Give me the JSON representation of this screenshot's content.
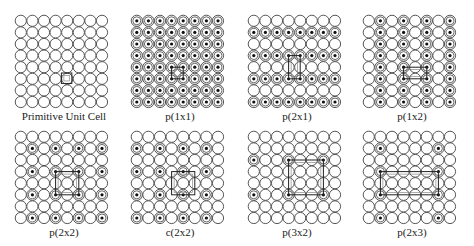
{
  "grid": {
    "rows": 8,
    "cols": 8,
    "pitch": 11.6,
    "radius": 5.6
  },
  "panels": [
    {
      "label": "Primitive Unit Cell",
      "x": 14,
      "y": 14,
      "dots": {
        "type": "none"
      },
      "cell": {
        "x0": 3.5,
        "y0": 4.5,
        "x1": 4.4,
        "y1": 5.4,
        "inner": true
      }
    },
    {
      "label": "p(1x1)",
      "x": 130,
      "y": 14,
      "dots": {
        "type": "all"
      },
      "cell": {
        "x0": 3,
        "y0": 4,
        "x1": 4,
        "y1": 5,
        "inner": true
      }
    },
    {
      "label": "p(2x1)",
      "x": 247,
      "y": 14,
      "dots": {
        "type": "rows",
        "step": 2,
        "offset": 1
      },
      "cell": {
        "x0": 3,
        "y0": 3,
        "x1": 4,
        "y1": 5,
        "inner": true
      }
    },
    {
      "label": "p(1x2)",
      "x": 362,
      "y": 14,
      "dots": {
        "type": "cols",
        "step": 2,
        "offset": 1
      },
      "cell": {
        "x0": 3,
        "y0": 4,
        "x1": 5,
        "y1": 5,
        "inner": true
      }
    },
    {
      "label": "p(2x2)",
      "x": 14,
      "y": 130,
      "dots": {
        "type": "lattice",
        "cstep": 2,
        "coff": 1,
        "rstep": 2,
        "roff": 1
      },
      "cell": {
        "x0": 3,
        "y0": 3,
        "x1": 5,
        "y1": 5,
        "inner": true
      }
    },
    {
      "label": "c(2x2)",
      "x": 130,
      "y": 130,
      "dots": {
        "type": "checker",
        "parity": 0
      },
      "cell": {
        "x0": 3,
        "y0": 3,
        "x1": 5,
        "y1": 5,
        "inner": true
      }
    },
    {
      "label": "p(3x2)",
      "x": 247,
      "y": 130,
      "dots": {
        "type": "lattice",
        "cstep": 3,
        "coff": 0,
        "rstep": 3,
        "roff": 2
      },
      "cell": {
        "x0": 3,
        "y0": 2,
        "x1": 6,
        "y1": 5,
        "inner": true
      }
    },
    {
      "label": "p(2x3)",
      "x": 362,
      "y": 130,
      "dots": {
        "type": "lattice2",
        "cols": [
          1,
          6
        ],
        "rows": [
          1,
          3,
          5,
          7
        ]
      },
      "cell": {
        "x0": 1,
        "y0": 3,
        "x1": 6,
        "y1": 5,
        "inner": true
      }
    }
  ],
  "colors": {
    "stroke": "#444444",
    "dot": "#111111",
    "fill": "#ffffff",
    "cell": "#222222"
  }
}
